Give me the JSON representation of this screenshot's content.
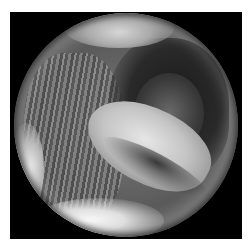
{
  "image": {
    "description": "Grayscale circular endoscopic view of an internal cavity with a bright central lobe, dark upper-right recess, and striated tissue on the left",
    "colors": {
      "background": "#ffffff",
      "frame": "#000000",
      "tissue_mid": "#7a7a7a",
      "highlight": "#e6e6e6",
      "shadow": "#1a1a1a"
    }
  }
}
